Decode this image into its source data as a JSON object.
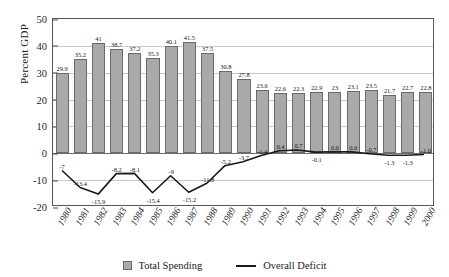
{
  "chart_data": {
    "type": "bar",
    "title": "",
    "subtitle": "",
    "xlabel": "",
    "ylabel": "Percent GDP",
    "ylim": [
      -20,
      50
    ],
    "yticks": [
      50,
      40,
      30,
      20,
      10,
      0,
      -10,
      -20
    ],
    "ytick_labels": [
      "50",
      "40",
      "30",
      "20",
      "10",
      "0",
      "-10",
      "-20"
    ],
    "grid": true,
    "legend_position": "bottom",
    "categories": [
      "1980",
      "1981",
      "1982",
      "1983",
      "1984",
      "1985",
      "1986",
      "1987",
      "1988",
      "1989",
      "1990",
      "1991",
      "1992",
      "1993",
      "1994",
      "1995",
      "1996",
      "1997",
      "1998",
      "1999",
      "2000"
    ],
    "series": [
      {
        "name": "Total Spending",
        "type": "bar",
        "color": "#a9a9a9",
        "values": [
          29.9,
          35.2,
          41,
          38.7,
          37.2,
          35.3,
          40.1,
          41.5,
          37.5,
          30.8,
          27.8,
          23.6,
          22.6,
          22.3,
          22.9,
          23,
          23.1,
          23.5,
          21.7,
          22.7,
          22.8
        ],
        "labels": [
          "29.9",
          "35.2",
          "41",
          "38.7",
          "37.2",
          "35.3",
          "40.1",
          "41.5",
          "37.5",
          "30.8",
          "27.8",
          "23.6",
          "22.6",
          "22.3",
          "22.9",
          "23",
          "23.1",
          "23.5",
          "21.7",
          "22.7",
          "22.8"
        ]
      },
      {
        "name": "Overall Deficit",
        "type": "line",
        "color": "#1a1a1a",
        "values": [
          -7,
          -13.4,
          -15.9,
          -8.2,
          -8.1,
          -15.4,
          -9,
          -15.2,
          -11.8,
          -5.2,
          -3.7,
          -1.4,
          0.4,
          0.7,
          -0.1,
          0.0,
          0.0,
          -0.7,
          -1.3,
          -1.3,
          -1.0
        ],
        "labels": [
          "-7",
          "-13.4",
          "-15.9",
          "-8.2",
          "-8.1",
          "-15.4",
          "-9",
          "-15.2",
          "-11.8",
          "-5.2",
          "-3.7",
          "-1.4",
          "0.4",
          "0.7",
          "-0.1",
          "0.0",
          "0.0",
          "-0.7",
          "-1.3",
          "-1.3",
          "-1.0"
        ]
      }
    ],
    "legend": [
      {
        "label": "Total Spending",
        "marker": "box",
        "color": "#a9a9a9"
      },
      {
        "label": "Overall Deficit",
        "marker": "line",
        "color": "#1a1a1a"
      }
    ]
  }
}
